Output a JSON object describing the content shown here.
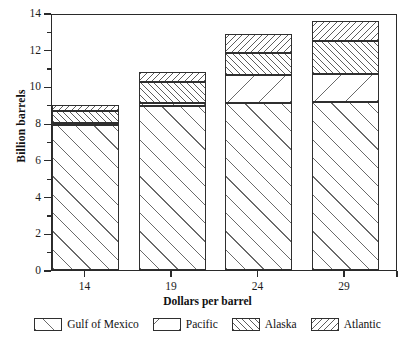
{
  "chart_data": {
    "type": "bar",
    "subtype": "stacked",
    "title": "",
    "xlabel": "Dollars per barrel",
    "ylabel": "Billion barrels",
    "categories": [
      "14",
      "19",
      "24",
      "29"
    ],
    "x": [
      14,
      19,
      24,
      29
    ],
    "series": [
      {
        "name": "Gulf of Mexico",
        "pattern": "diagonal-sparse-forward",
        "values": [
          7.9,
          8.95,
          9.1,
          9.15
        ]
      },
      {
        "name": "Pacific",
        "pattern": "diagonal-very-sparse-back",
        "values": [
          0.1,
          0.15,
          1.5,
          1.55
        ]
      },
      {
        "name": "Alaska",
        "pattern": "diagonal-dense-forward",
        "values": [
          0.65,
          1.15,
          1.2,
          1.8
        ]
      },
      {
        "name": "Atlantic",
        "pattern": "diagonal-dense-back",
        "values": [
          0.35,
          0.55,
          1.05,
          1.05
        ]
      }
    ],
    "totals": [
      9.0,
      10.8,
      12.85,
      13.55
    ],
    "ylim": [
      0,
      14
    ],
    "yticks": [
      0,
      2,
      4,
      6,
      8,
      10,
      12,
      14
    ],
    "yticks_minor": [
      1,
      3,
      5,
      7,
      9,
      11,
      13
    ],
    "ytick_labels": [
      "0",
      "2",
      "4",
      "6",
      "8",
      "10",
      "12",
      "14"
    ],
    "grid": false,
    "legend_position": "bottom",
    "colors": {
      "axis": "#2a2a2a",
      "bar_outline": "#2f2f2f",
      "hatch": "#6a6a6a",
      "background": "#ffffff"
    }
  },
  "legend": {
    "items": [
      {
        "label": "Gulf of Mexico",
        "pattern": "diagonal-sparse-forward"
      },
      {
        "label": "Pacific",
        "pattern": "diagonal-very-sparse-back"
      },
      {
        "label": "Alaska",
        "pattern": "diagonal-dense-forward"
      },
      {
        "label": "Atlantic",
        "pattern": "diagonal-dense-back"
      }
    ]
  }
}
